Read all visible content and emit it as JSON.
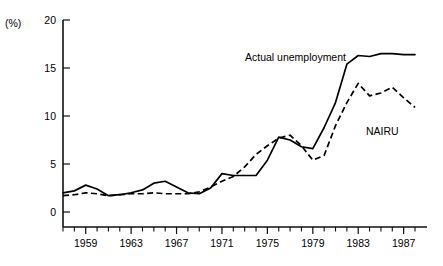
{
  "chart_data": {
    "type": "line",
    "title": "",
    "xlabel": "",
    "ylabel": "(%)",
    "ylim": [
      0,
      20
    ],
    "xlim": [
      1957,
      1988
    ],
    "grid": false,
    "legend_position": "inline-annotations",
    "y_ticks": [
      0,
      5,
      10,
      15,
      20
    ],
    "y_ticklabels": [
      "0",
      "5",
      "10",
      "15",
      "20"
    ],
    "x_ticklabels": [
      "1959",
      "1963",
      "1967",
      "1971",
      "1975",
      "1979",
      "1983",
      "1987"
    ],
    "x_ticklabel_years": [
      1959,
      1963,
      1967,
      1971,
      1975,
      1979,
      1983,
      1987
    ],
    "x_tick_years_all": [
      1957,
      1958,
      1959,
      1960,
      1961,
      1962,
      1963,
      1964,
      1965,
      1966,
      1967,
      1968,
      1969,
      1970,
      1971,
      1972,
      1973,
      1974,
      1975,
      1976,
      1977,
      1978,
      1979,
      1980,
      1981,
      1982,
      1983,
      1984,
      1985,
      1986,
      1987,
      1988
    ],
    "x": [
      1957,
      1958,
      1959,
      1960,
      1961,
      1962,
      1963,
      1964,
      1965,
      1966,
      1967,
      1968,
      1969,
      1970,
      1971,
      1972,
      1973,
      1974,
      1975,
      1976,
      1977,
      1978,
      1979,
      1980,
      1981,
      1982,
      1983,
      1984,
      1985,
      1986,
      1987,
      1988
    ],
    "series": [
      {
        "name": "Actual unemployment",
        "style": "solid",
        "color": "#000000",
        "values": [
          2.0,
          2.2,
          2.8,
          2.4,
          1.7,
          1.8,
          2.0,
          2.3,
          3.0,
          3.2,
          2.6,
          2.0,
          1.9,
          2.5,
          4.0,
          3.8,
          3.8,
          3.8,
          5.4,
          7.8,
          7.5,
          6.8,
          6.6,
          8.8,
          11.4,
          15.4,
          16.3,
          16.2,
          16.5,
          16.5,
          16.4,
          16.4
        ]
      },
      {
        "name": "NAIRU",
        "style": "dashed",
        "color": "#000000",
        "values": [
          1.7,
          1.8,
          2.0,
          1.9,
          1.7,
          1.8,
          1.9,
          1.9,
          2.0,
          1.9,
          1.9,
          1.9,
          2.1,
          2.6,
          3.2,
          3.7,
          4.7,
          6.0,
          6.9,
          7.7,
          8.0,
          6.9,
          5.4,
          5.9,
          9.0,
          11.4,
          13.4,
          12.1,
          12.4,
          13.0,
          11.9,
          10.9
        ]
      }
    ],
    "annotations": [
      {
        "name": "actual-unemployment-label",
        "text": "Actual unemployment",
        "x_px": 245,
        "y_px": 61
      },
      {
        "name": "nairu-label",
        "text": "NAIRU",
        "x_px": 366,
        "y_px": 135
      }
    ]
  }
}
